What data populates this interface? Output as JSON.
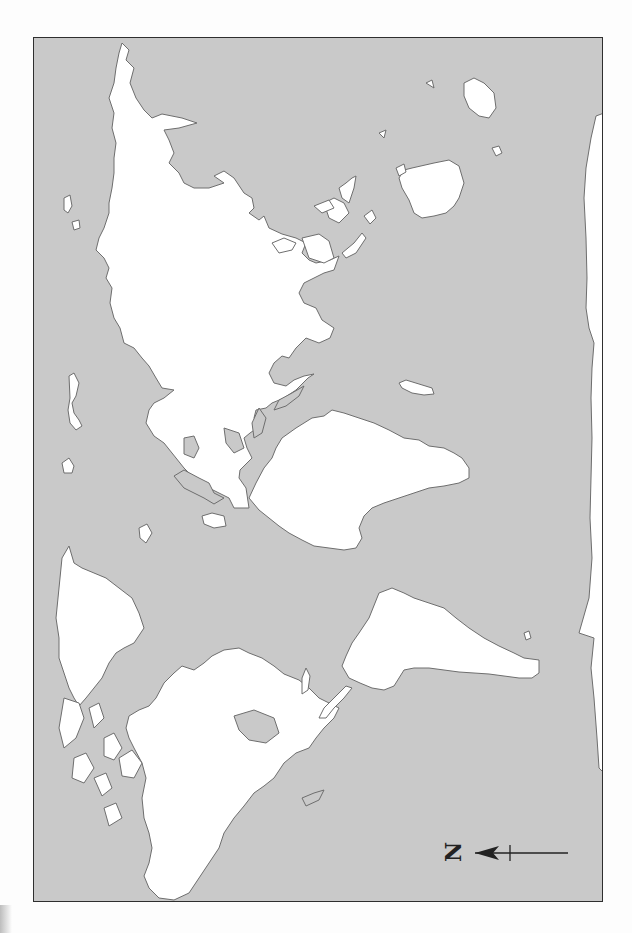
{
  "map": {
    "type": "blank world outline map",
    "orientation": "rotated 90 degrees, north points left",
    "colors": {
      "ocean": "#c9c9c9",
      "land": "#ffffff",
      "coastline": "#6e6e6e",
      "frame": "#2f2f2f"
    },
    "landmasses": [
      "Australia",
      "New Guinea",
      "Maritime Southeast Asia",
      "Eurasia",
      "Africa",
      "Madagascar",
      "Greenland",
      "North America",
      "South America",
      "Antarctica"
    ]
  },
  "compass": {
    "letter": "N",
    "direction": "left"
  }
}
